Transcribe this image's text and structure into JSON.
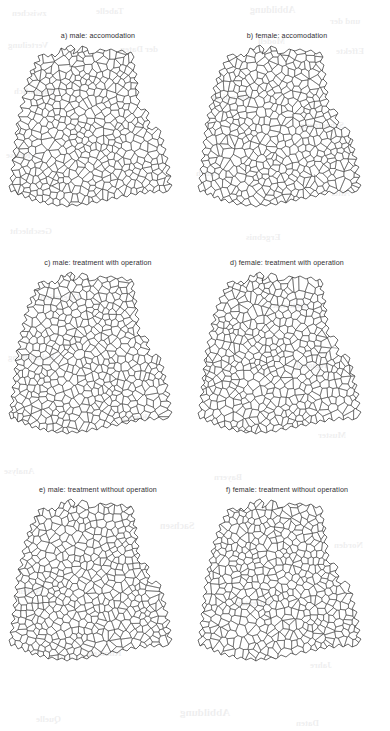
{
  "figure": {
    "type": "choropleth-panel-grid",
    "rows": 3,
    "columns": 2,
    "region": "Germany",
    "unit": "districts (Kreise)"
  },
  "panels": [
    {
      "id": "a",
      "caption": "a) male: accomodation",
      "sex": "male",
      "outcome": "accomodation"
    },
    {
      "id": "b",
      "caption": "b) female: accomodation",
      "sex": "female",
      "outcome": "accomodation"
    },
    {
      "id": "c",
      "caption": "c) male: treatment with operation",
      "sex": "male",
      "outcome": "treatment with operation"
    },
    {
      "id": "d",
      "caption": "d) female: treatment with operation",
      "sex": "female",
      "outcome": "treatment with operation"
    },
    {
      "id": "e",
      "caption": "e) male: treatment without operation",
      "sex": "male",
      "outcome": "treatment without operation"
    },
    {
      "id": "f",
      "caption": "f) female: treatment without operation",
      "sex": "female",
      "outcome": "treatment without operation"
    }
  ],
  "shading": {
    "levels": 3,
    "colors": [
      "#ffffff",
      "#9b9b9b",
      "#1c1c1c"
    ],
    "level_names": [
      "low",
      "medium",
      "high"
    ]
  },
  "chart_data": {
    "type": "heatmap",
    "title": "",
    "xlabel": "",
    "ylabel": "",
    "categories": [
      "a) male: accomodation",
      "b) female: accomodation",
      "c) male: treatment with operation",
      "d) female: treatment with operation",
      "e) male: treatment without operation",
      "f) female: treatment without operation"
    ],
    "legend": [
      "low",
      "medium",
      "high"
    ],
    "grid": false,
    "series": [
      {
        "name": "a) male: accomodation",
        "regions": {
          "schleswig-holstein": "low",
          "hamburg": "medium",
          "mecklenburg-vorpommern": "low",
          "niedersachsen": "medium",
          "bremen": "medium",
          "nordrhein-westfalen": "high",
          "hessen": "medium",
          "rheinland-pfalz": "medium",
          "saarland": "high",
          "baden-wuerttemberg": "medium",
          "bayern": "medium",
          "bayern-south-east": "high",
          "berlin": "low",
          "brandenburg": "low",
          "sachsen-anhalt": "low",
          "thueringen": "medium",
          "sachsen": "medium"
        }
      },
      {
        "name": "b) female: accomodation",
        "regions": {
          "schleswig-holstein": "low",
          "hamburg": "low",
          "mecklenburg-vorpommern": "low",
          "niedersachsen": "medium",
          "bremen": "medium",
          "nordrhein-westfalen": "medium",
          "nordrhein-westfalen-west": "high",
          "hessen": "medium",
          "rheinland-pfalz": "medium",
          "saarland": "medium",
          "baden-wuerttemberg": "medium",
          "bayern": "medium",
          "bayern-north-east": "high",
          "bayern-south-east": "high",
          "berlin": "low",
          "brandenburg": "low",
          "sachsen-anhalt": "low",
          "thueringen": "medium",
          "sachsen": "medium"
        }
      },
      {
        "name": "c) male: treatment with operation",
        "regions": {
          "schleswig-holstein": "low",
          "hamburg": "medium",
          "mecklenburg-vorpommern": "low",
          "niedersachsen": "low",
          "bremen": "medium",
          "nordrhein-westfalen": "medium",
          "hessen": "medium",
          "rheinland-pfalz": "low",
          "saarland": "medium",
          "baden-wuerttemberg": "medium",
          "bayern": "high",
          "berlin": "low",
          "brandenburg": "low",
          "sachsen-anhalt": "low",
          "thueringen": "high",
          "sachsen": "high"
        }
      },
      {
        "name": "d) female: treatment with operation",
        "regions": {
          "schleswig-holstein": "low",
          "hamburg": "medium",
          "mecklenburg-vorpommern": "low",
          "niedersachsen": "medium",
          "bremen": "medium",
          "nordrhein-westfalen": "medium",
          "hessen": "medium",
          "rheinland-pfalz": "medium",
          "saarland": "medium",
          "baden-wuerttemberg": "medium",
          "bayern": "high",
          "berlin": "low",
          "brandenburg": "low",
          "sachsen-anhalt": "low",
          "thueringen": "high",
          "sachsen": "high"
        }
      },
      {
        "name": "e) male: treatment without operation",
        "regions": {
          "schleswig-holstein": "medium",
          "hamburg": "medium",
          "mecklenburg-vorpommern": "medium",
          "niedersachsen": "high",
          "bremen": "high",
          "nordrhein-westfalen": "high",
          "hessen": "medium",
          "rheinland-pfalz": "low",
          "saarland": "low",
          "baden-wuerttemberg": "medium",
          "bayern": "medium",
          "berlin": "medium",
          "brandenburg": "medium",
          "sachsen-anhalt": "medium",
          "thueringen": "high",
          "sachsen": "high"
        }
      },
      {
        "name": "f) female: treatment without operation",
        "regions": {
          "schleswig-holstein": "medium",
          "hamburg": "medium",
          "mecklenburg-vorpommern": "medium",
          "niedersachsen": "medium",
          "bremen": "medium",
          "nordrhein-westfalen": "medium",
          "nordrhein-westfalen-west": "high",
          "hessen": "medium",
          "rheinland-pfalz": "low",
          "saarland": "low",
          "baden-wuerttemberg": "medium",
          "bayern": "medium",
          "berlin": "medium",
          "brandenburg": "medium",
          "sachsen-anhalt": "medium",
          "thueringen": "high",
          "sachsen": "high"
        }
      }
    ]
  },
  "bleedthrough": [
    {
      "text": "zwischen",
      "x": 12,
      "y": 8,
      "size": 9
    },
    {
      "text": "Tabelle",
      "x": 96,
      "y": 6,
      "size": 9
    },
    {
      "text": "Abbildung",
      "x": 250,
      "y": 4,
      "size": 10
    },
    {
      "text": "und der",
      "x": 330,
      "y": 16,
      "size": 9
    },
    {
      "text": "Verteilung",
      "x": 8,
      "y": 40,
      "size": 9
    },
    {
      "text": "der Daten",
      "x": 120,
      "y": 44,
      "size": 9
    },
    {
      "text": "Modell",
      "x": 258,
      "y": 36,
      "size": 9
    },
    {
      "text": "Effekte",
      "x": 336,
      "y": 46,
      "size": 9
    },
    {
      "text": "raeumlich",
      "x": 14,
      "y": 86,
      "size": 9
    },
    {
      "text": "korreliert",
      "x": 212,
      "y": 92,
      "size": 9
    },
    {
      "text": "Schaetzung",
      "x": 300,
      "y": 120,
      "size": 9
    },
    {
      "text": "Kreise",
      "x": 6,
      "y": 150,
      "size": 9
    },
    {
      "text": "nach",
      "x": 196,
      "y": 168,
      "size": 9
    },
    {
      "text": "Alter",
      "x": 330,
      "y": 188,
      "size": 9
    },
    {
      "text": "Geschlecht",
      "x": 10,
      "y": 226,
      "size": 9
    },
    {
      "text": "Ergebnis",
      "x": 246,
      "y": 232,
      "size": 9
    },
    {
      "text": "Operation",
      "x": 40,
      "y": 292,
      "size": 9
    },
    {
      "text": "stationaer",
      "x": 268,
      "y": 300,
      "size": 9
    },
    {
      "text": "Behandlung",
      "x": 8,
      "y": 352,
      "size": 9
    },
    {
      "text": "regional",
      "x": 296,
      "y": 360,
      "size": 9
    },
    {
      "text": "Karten",
      "x": 120,
      "y": 412,
      "size": 9
    },
    {
      "text": "Muster",
      "x": 318,
      "y": 430,
      "size": 9
    },
    {
      "text": "Analyse",
      "x": 4,
      "y": 466,
      "size": 9
    },
    {
      "text": "Bayern",
      "x": 214,
      "y": 472,
      "size": 9
    },
    {
      "text": "Sachsen",
      "x": 160,
      "y": 520,
      "size": 10
    },
    {
      "text": "Norden",
      "x": 334,
      "y": 540,
      "size": 9
    },
    {
      "text": "Anteil",
      "x": 18,
      "y": 586,
      "size": 9
    },
    {
      "text": "Patienten",
      "x": 236,
      "y": 598,
      "size": 9
    },
    {
      "text": "Kliniken",
      "x": 88,
      "y": 648,
      "size": 9
    },
    {
      "text": "Jahre",
      "x": 310,
      "y": 660,
      "size": 9
    },
    {
      "text": "Abbildung",
      "x": 180,
      "y": 706,
      "size": 11
    },
    {
      "text": "Quelle",
      "x": 36,
      "y": 714,
      "size": 9
    },
    {
      "text": "Daten",
      "x": 296,
      "y": 718,
      "size": 9
    }
  ]
}
